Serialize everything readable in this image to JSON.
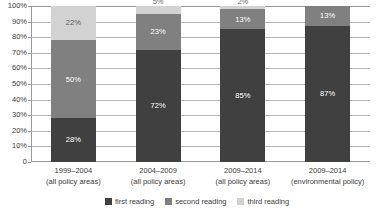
{
  "chart_data": {
    "type": "bar",
    "subtype": "stacked-percentage",
    "title": "",
    "subtitle": "",
    "xlabel": "",
    "ylabel": "",
    "ylim": [
      0,
      100
    ],
    "yticks": [
      "0",
      "10%",
      "20%",
      "30%",
      "40%",
      "50%",
      "60%",
      "70%",
      "80%",
      "90%",
      "100%"
    ],
    "ytick_values": [
      0,
      10,
      20,
      30,
      40,
      50,
      60,
      70,
      80,
      90,
      100
    ],
    "grid": true,
    "grid_axis": "y",
    "legend_position": "bottom",
    "categories": [
      "1999–2004\n(all policy areas)",
      "2004–2009\n(all policy areas)",
      "2009–2014\n(all policy areas)",
      "2009–2014\n(environmental policy)"
    ],
    "category_lines": [
      [
        "1999–2004",
        "(all policy areas)"
      ],
      [
        "2004–2009",
        "(all policy areas)"
      ],
      [
        "2009–2014",
        "(all policy areas)"
      ],
      [
        "2009–2014",
        "(environmental policy)"
      ]
    ],
    "series": [
      {
        "name": "first reading",
        "color": "#404040",
        "values": [
          28,
          72,
          85,
          87
        ],
        "labels": [
          "28%",
          "72%",
          "85%",
          "87%"
        ]
      },
      {
        "name": "second reading",
        "color": "#808080",
        "values": [
          50,
          23,
          13,
          13
        ],
        "labels": [
          "50%",
          "23%",
          "13%",
          "13%"
        ]
      },
      {
        "name": "third reading",
        "color": "#d2d2d2",
        "values": [
          22,
          5,
          2,
          0
        ],
        "labels": [
          "22%",
          "5%",
          "2%",
          ""
        ]
      }
    ]
  },
  "legend": {
    "items": [
      {
        "label": "first reading",
        "color": "#404040"
      },
      {
        "label": "second reading",
        "color": "#808080"
      },
      {
        "label": "third reading",
        "color": "#d2d2d2"
      }
    ]
  },
  "axis": {
    "y_labels": [
      "100%",
      "90%",
      "80%",
      "70%",
      "60%",
      "50%",
      "40%",
      "30%",
      "20%",
      "10%",
      "0"
    ]
  },
  "colors": {
    "first_reading": "#404040",
    "second_reading": "#808080",
    "third_reading": "#d2d2d2",
    "gridline": "#b6b6b6",
    "axis": "#9a9a9a",
    "text": "#3b3b3b",
    "background": "#ffffff"
  }
}
